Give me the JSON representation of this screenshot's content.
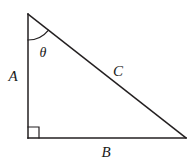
{
  "figure": {
    "kind": "right-triangle-diagram",
    "background_color": "#ffffff",
    "stroke_color": "#231f20",
    "label_color": "#1a1a1a",
    "stroke_width": 1.5,
    "vertices": {
      "apex": {
        "x": 28,
        "y": 14
      },
      "right_angle": {
        "x": 28,
        "y": 138
      },
      "base_right": {
        "x": 186,
        "y": 138
      }
    },
    "sides": [
      {
        "name": "vertical-leg",
        "label": "A",
        "from": {
          "x": 28,
          "y": 14
        },
        "to": {
          "x": 28,
          "y": 138
        }
      },
      {
        "name": "horizontal-leg",
        "label": "B",
        "from": {
          "x": 28,
          "y": 138
        },
        "to": {
          "x": 186,
          "y": 138
        }
      },
      {
        "name": "hypotenuse",
        "label": "C",
        "from": {
          "x": 28,
          "y": 14
        },
        "to": {
          "x": 186,
          "y": 138
        }
      }
    ],
    "angle_mark": {
      "name": "theta-arc",
      "label": "θ",
      "vertex": {
        "x": 28,
        "y": 14
      },
      "radius": 26
    },
    "right_angle_mark": {
      "name": "right-angle-square",
      "size": 11
    },
    "labels": {
      "side_a": {
        "text": "A",
        "x": 13,
        "y": 76
      },
      "side_b": {
        "text": "B",
        "x": 106,
        "y": 152
      },
      "side_c": {
        "text": "C",
        "x": 118,
        "y": 71
      },
      "angle_theta": {
        "text": "θ",
        "x": 43,
        "y": 53
      }
    }
  }
}
